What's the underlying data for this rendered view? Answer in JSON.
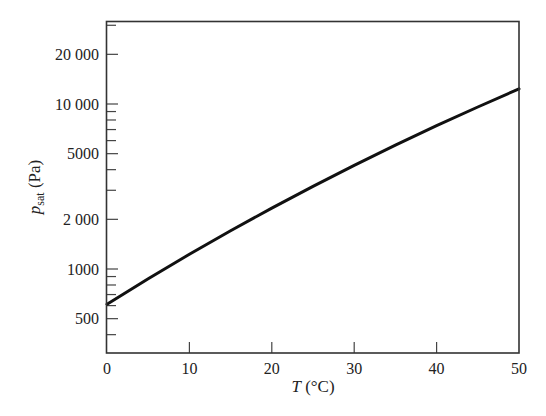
{
  "chart_data": {
    "type": "line",
    "title": "",
    "xlabel": "T (°C)",
    "xlabel_italic": "T",
    "xlabel_rest": " (°C)",
    "ylabel_main": "p",
    "ylabel_sub": "sat",
    "ylabel_rest": " (Pa)",
    "ylabel": "p_sat (Pa)",
    "xscale": "linear",
    "yscale": "log",
    "xlim": [
      0,
      50
    ],
    "ylim": [
      310,
      31800
    ],
    "grid": false,
    "legend": null,
    "x_ticks": [
      0,
      10,
      20,
      30,
      40,
      50
    ],
    "x_tick_labels": [
      "0",
      "10",
      "20",
      "30",
      "40",
      "50"
    ],
    "y_major_ticks": [
      500,
      1000,
      2000,
      5000,
      10000,
      20000
    ],
    "y_tick_labels": [
      "500",
      "1000",
      "2 000",
      "5000",
      "10 000",
      "20 000"
    ],
    "y_minor_ticks": [
      400,
      600,
      700,
      800,
      900,
      3000,
      4000,
      6000,
      7000,
      8000,
      9000,
      30000
    ],
    "series": [
      {
        "name": "Saturation vapor pressure of water",
        "color": "#111111",
        "x": [
          0,
          5,
          10,
          15,
          20,
          25,
          30,
          35,
          40,
          45,
          50
        ],
        "values": [
          611,
          872,
          1228,
          1705,
          2339,
          3169,
          4247,
          5628,
          7384,
          9593,
          12352
        ]
      }
    ]
  }
}
